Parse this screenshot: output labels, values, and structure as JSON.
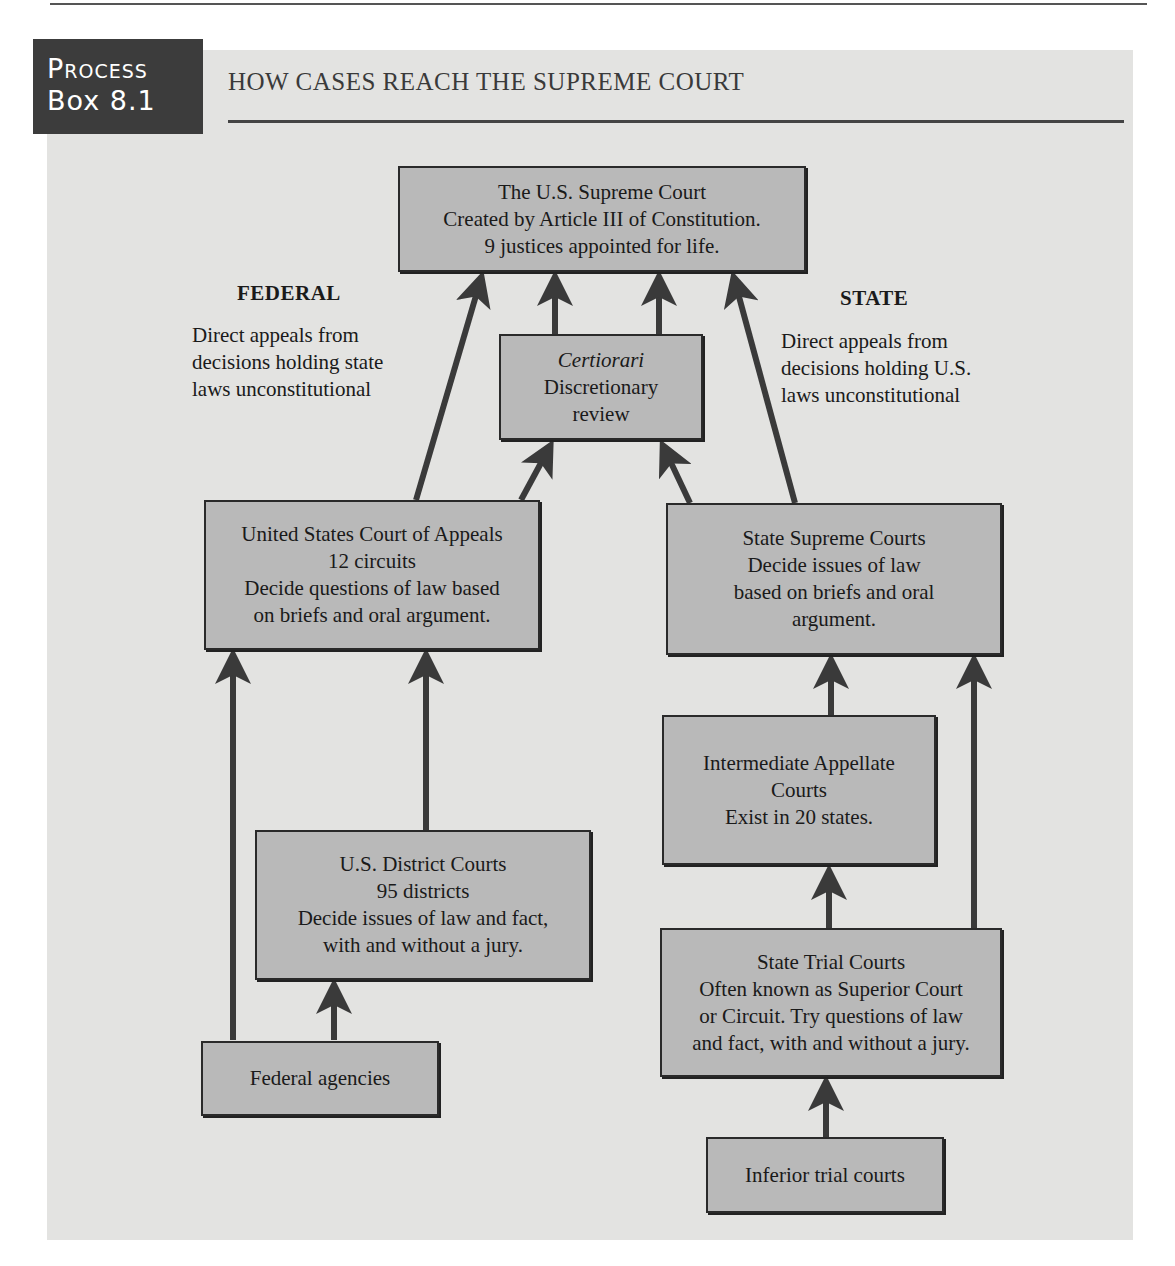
{
  "label": {
    "line1": "Process",
    "line2": "Box 8.1"
  },
  "title": "HOW CASES REACH THE SUPREME COURT",
  "sections": {
    "federal": {
      "heading": "FEDERAL",
      "note": [
        "Direct appeals from",
        "decisions holding state",
        "laws unconstitutional"
      ]
    },
    "state": {
      "heading": "STATE",
      "note": [
        "Direct appeals from",
        "decisions holding U.S.",
        "laws unconstitutional"
      ]
    }
  },
  "boxes": {
    "supreme_court": [
      "The U.S. Supreme Court",
      "Created by Article III of Constitution.",
      "9 justices appointed for life."
    ],
    "certiorari": [
      "Certiorari",
      "Discretionary",
      "review"
    ],
    "court_of_appeals": [
      "United States Court of Appeals",
      "12 circuits",
      "Decide questions of law based",
      "on briefs and oral argument."
    ],
    "state_supreme": [
      "State Supreme Courts",
      "Decide issues of law",
      "based on briefs and oral",
      "argument."
    ],
    "intermediate_appellate": [
      "Intermediate Appellate",
      "Courts",
      "Exist in 20 states."
    ],
    "district_courts": [
      "U.S. District Courts",
      "95 districts",
      "Decide issues of law and fact,",
      "with and without a jury."
    ],
    "state_trial": [
      "State Trial Courts",
      "Often known as Superior Court",
      "or Circuit. Try questions of law",
      "and fact, with and without a jury."
    ],
    "federal_agencies": [
      "Federal agencies"
    ],
    "inferior_trial": [
      "Inferior trial courts"
    ]
  },
  "colors": {
    "panel": "#e3e3e1",
    "box_fill": "#b9b9b9",
    "label_bg": "#3c3c3c",
    "arrow": "#3a3a3a"
  }
}
